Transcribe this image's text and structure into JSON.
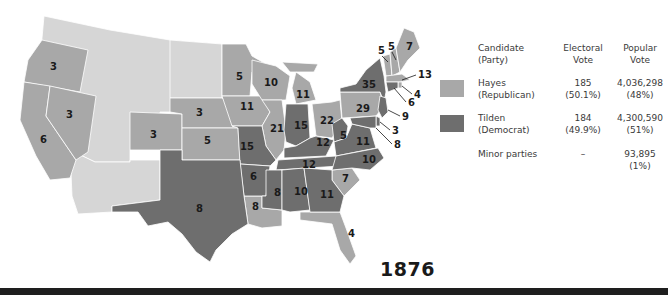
{
  "year": "1876",
  "colors": {
    "republican": "#a8a8a8",
    "democrat": "#6e6e6e",
    "territory": "#d6d6d6",
    "border": "#ffffff",
    "label": "#1a1a1a"
  },
  "legend": {
    "headers": {
      "candidate": [
        "Candidate",
        "(Party)"
      ],
      "electoral": [
        "Electoral",
        "Vote"
      ],
      "popular": [
        "Popular",
        "Vote"
      ]
    },
    "rows": [
      {
        "name": "Hayes",
        "party": "(Republican)",
        "electoral_vote": "185",
        "electoral_pct": "(50.1%)",
        "popular_vote": "4,036,298",
        "popular_pct": "(48%)",
        "swatch": "#a8a8a8"
      },
      {
        "name": "Tilden",
        "party": "(Democrat)",
        "electoral_vote": "184",
        "electoral_pct": "(49.9%)",
        "popular_vote": "4,300,590",
        "popular_pct": "(51%)",
        "swatch": "#6e6e6e"
      },
      {
        "name": "Minor parties",
        "party": "",
        "electoral_vote": "–",
        "electoral_pct": "",
        "popular_vote": "93,895",
        "popular_pct": "(1%)",
        "swatch": null
      }
    ]
  },
  "states": [
    {
      "name": "Oregon",
      "ev": "3",
      "winner": "Hayes"
    },
    {
      "name": "Nevada",
      "ev": "3",
      "winner": "Hayes"
    },
    {
      "name": "California",
      "ev": "6",
      "winner": "Hayes"
    },
    {
      "name": "Colorado",
      "ev": "3",
      "winner": "Hayes"
    },
    {
      "name": "Nebraska",
      "ev": "3",
      "winner": "Hayes"
    },
    {
      "name": "Kansas",
      "ev": "5",
      "winner": "Hayes"
    },
    {
      "name": "Minnesota",
      "ev": "5",
      "winner": "Hayes"
    },
    {
      "name": "Iowa",
      "ev": "11",
      "winner": "Hayes"
    },
    {
      "name": "Wisconsin",
      "ev": "10",
      "winner": "Hayes"
    },
    {
      "name": "Michigan",
      "ev": "11",
      "winner": "Hayes"
    },
    {
      "name": "Illinois",
      "ev": "21",
      "winner": "Hayes"
    },
    {
      "name": "Ohio",
      "ev": "22",
      "winner": "Hayes"
    },
    {
      "name": "Pennsylvania",
      "ev": "29",
      "winner": "Hayes"
    },
    {
      "name": "Vermont",
      "ev": "5",
      "winner": "Hayes"
    },
    {
      "name": "New Hampshire",
      "ev": "5",
      "winner": "Hayes"
    },
    {
      "name": "Maine",
      "ev": "7",
      "winner": "Hayes"
    },
    {
      "name": "Massachusetts",
      "ev": "13",
      "winner": "Hayes"
    },
    {
      "name": "Rhode Island",
      "ev": "4",
      "winner": "Hayes"
    },
    {
      "name": "Louisiana",
      "ev": "8",
      "winner": "Hayes"
    },
    {
      "name": "South Carolina",
      "ev": "7",
      "winner": "Hayes"
    },
    {
      "name": "Florida",
      "ev": "4",
      "winner": "Hayes"
    },
    {
      "name": "Missouri",
      "ev": "15",
      "winner": "Tilden"
    },
    {
      "name": "Indiana",
      "ev": "15",
      "winner": "Tilden"
    },
    {
      "name": "Kentucky",
      "ev": "12",
      "winner": "Tilden"
    },
    {
      "name": "Tennessee",
      "ev": "12",
      "winner": "Tilden"
    },
    {
      "name": "West Virginia",
      "ev": "5",
      "winner": "Tilden"
    },
    {
      "name": "Virginia",
      "ev": "11",
      "winner": "Tilden"
    },
    {
      "name": "North Carolina",
      "ev": "10",
      "winner": "Tilden"
    },
    {
      "name": "Arkansas",
      "ev": "6",
      "winner": "Tilden"
    },
    {
      "name": "Texas",
      "ev": "8",
      "winner": "Tilden"
    },
    {
      "name": "Mississippi",
      "ev": "8",
      "winner": "Tilden"
    },
    {
      "name": "Alabama",
      "ev": "10",
      "winner": "Tilden"
    },
    {
      "name": "Georgia",
      "ev": "11",
      "winner": "Tilden"
    },
    {
      "name": "New York",
      "ev": "35",
      "winner": "Tilden"
    },
    {
      "name": "Connecticut",
      "ev": "6",
      "winner": "Tilden"
    },
    {
      "name": "New Jersey",
      "ev": "9",
      "winner": "Tilden"
    },
    {
      "name": "Delaware",
      "ev": "3",
      "winner": "Tilden"
    },
    {
      "name": "Maryland",
      "ev": "8",
      "winner": "Tilden"
    }
  ]
}
